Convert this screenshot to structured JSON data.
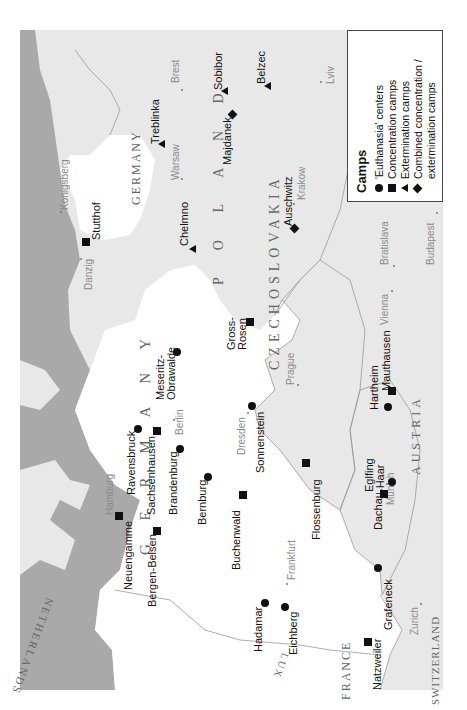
{
  "legend": {
    "title": "Camps",
    "items": [
      {
        "symbol": "circle",
        "label": "'Euthanasia' centers"
      },
      {
        "symbol": "square",
        "label": "Concentration camps"
      },
      {
        "symbol": "triangle",
        "label": "Extermination camps"
      },
      {
        "symbol": "diamond",
        "label": "Combined concentration / extermination camps"
      }
    ]
  },
  "colors": {
    "sea": "#a9a9a9",
    "germany": "#ffffff",
    "other_land": "#e8e8e8",
    "marker": "#111111",
    "city_text": "#8a8a8a"
  },
  "countries": {
    "germany": "G E R M A N Y",
    "east_prussia": "GERMANY",
    "poland": "P O L A N D",
    "czechoslovakia": "CZECHOSLOVAKIA",
    "austria": "AUSTRIA",
    "netherlands": "NETHERLANDS",
    "lux": "LUX",
    "france": "FRANCE",
    "switzerland": "SWITZERLAND"
  },
  "cities": [
    {
      "name": "Konigsberg"
    },
    {
      "name": "Danzig"
    },
    {
      "name": "Warsaw"
    },
    {
      "name": "Brest"
    },
    {
      "name": "Krakow"
    },
    {
      "name": "Lviv"
    },
    {
      "name": "Budapest"
    },
    {
      "name": "Bratislava"
    },
    {
      "name": "Vienna"
    },
    {
      "name": "Prague"
    },
    {
      "name": "Dresden"
    },
    {
      "name": "Berlin"
    },
    {
      "name": "Hamburg"
    },
    {
      "name": "Frankfurt"
    },
    {
      "name": "Munich"
    },
    {
      "name": "Zurich"
    }
  ],
  "camps": [
    {
      "name": "Stutthof",
      "type": "square"
    },
    {
      "name": "Chelmno",
      "type": "triangle"
    },
    {
      "name": "Treblinka",
      "type": "triangle"
    },
    {
      "name": "Sobibor",
      "type": "triangle"
    },
    {
      "name": "Majdanek",
      "type": "diamond"
    },
    {
      "name": "Belzec",
      "type": "triangle"
    },
    {
      "name": "Auschwitz",
      "type": "diamond"
    },
    {
      "name": "Meseritz-",
      "type": "circle"
    },
    {
      "name": "Obrawalde",
      "type": "circle"
    },
    {
      "name": "Gross-",
      "type": "square"
    },
    {
      "name": "Rosen",
      "type": "square"
    },
    {
      "name": "Ravensbruck",
      "type": "circle"
    },
    {
      "name": "Sachsenhausen",
      "type": "square"
    },
    {
      "name": "Brandenburg",
      "type": "circle"
    },
    {
      "name": "Bernburg",
      "type": "circle"
    },
    {
      "name": "Sonnenstein",
      "type": "circle"
    },
    {
      "name": "Buchenwald",
      "type": "square"
    },
    {
      "name": "Flossenburg",
      "type": "square"
    },
    {
      "name": "Neuengamme",
      "type": "square"
    },
    {
      "name": "Bergen-Belsen",
      "type": "square"
    },
    {
      "name": "Hadamar",
      "type": "circle"
    },
    {
      "name": "Eichberg",
      "type": "circle"
    },
    {
      "name": "Hartheim",
      "type": "circle"
    },
    {
      "name": "Mauthausen",
      "type": "square"
    },
    {
      "name": "Dachau",
      "type": "square"
    },
    {
      "name": "Eglfing",
      "type": "circle"
    },
    {
      "name": "-Haar",
      "type": "circle"
    },
    {
      "name": "Grafeneck",
      "type": "circle"
    },
    {
      "name": "Natzweiler",
      "type": "square"
    }
  ]
}
